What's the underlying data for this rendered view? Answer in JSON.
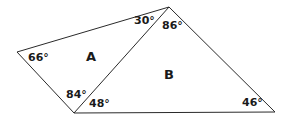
{
  "diagram": {
    "line_color": "#2a2a2a",
    "vertices": {
      "left": [
        17,
        52
      ],
      "top": [
        169,
        7
      ],
      "bottom_left": [
        74,
        113
      ],
      "bottom_right": [
        275,
        112
      ]
    },
    "regions": [
      {
        "label": "A",
        "pos": [
          86,
          50
        ]
      },
      {
        "label": "B",
        "pos": [
          164,
          68
        ]
      }
    ],
    "angles": [
      {
        "label": "66°",
        "pos": [
          28,
          52
        ],
        "triangle": "A",
        "vertex": "left"
      },
      {
        "label": "30°",
        "pos": [
          134,
          15
        ],
        "triangle": "A",
        "vertex": "top"
      },
      {
        "label": "84°",
        "pos": [
          66,
          89
        ],
        "triangle": "A",
        "vertex": "bottom_left"
      },
      {
        "label": "86°",
        "pos": [
          162,
          20
        ],
        "triangle": "B",
        "vertex": "top"
      },
      {
        "label": "48°",
        "pos": [
          89,
          98
        ],
        "triangle": "B",
        "vertex": "bottom_left"
      },
      {
        "label": "46°",
        "pos": [
          242,
          97
        ],
        "triangle": "B",
        "vertex": "bottom_right"
      }
    ]
  }
}
